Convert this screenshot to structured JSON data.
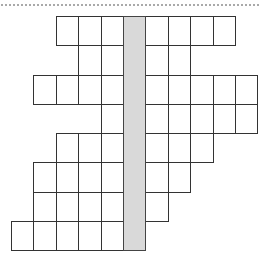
{
  "diagram": {
    "title": "",
    "colors": {
      "shaded_column": "#d9d9d9",
      "cell_border": "#333333",
      "dotted_rule": "#a9a9a9"
    },
    "grid": {
      "origin_x": 11,
      "origin_y": 16,
      "cell_w": 22.4,
      "cell_h": 29.25,
      "column_count": 11,
      "row_count": 8,
      "shaded_column_index": 5
    },
    "rows": [
      {
        "row": 1,
        "left_cells": 3,
        "right_cells": 4
      },
      {
        "row": 2,
        "left_cells": 2,
        "right_cells": 2
      },
      {
        "row": 3,
        "left_cells": 4,
        "right_cells": 5
      },
      {
        "row": 4,
        "left_cells": 1,
        "right_cells": 5
      },
      {
        "row": 5,
        "left_cells": 3,
        "right_cells": 3
      },
      {
        "row": 6,
        "left_cells": 4,
        "right_cells": 2
      },
      {
        "row": 7,
        "left_cells": 4,
        "right_cells": 1
      },
      {
        "row": 8,
        "left_cells": 5,
        "right_cells": 0
      }
    ]
  }
}
